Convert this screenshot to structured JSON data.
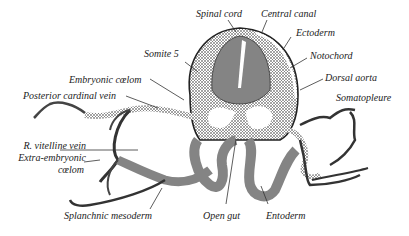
{
  "figure": {
    "labels": {
      "spinal_cord": "Spinal cord",
      "central_canal": "Central canal",
      "ectoderm": "Ectoderm",
      "somite": "Somite 5",
      "notochord": "Notochord",
      "embryonic_coelom": "Embryonic cœlom",
      "dorsal_aorta": "Dorsal aorta",
      "posterior_cardinal_vein": "Posterior cardinal vein",
      "somatopleure": "Somatopleure",
      "r_vitelline_vein": "R. vitelline vein",
      "extra_embryonic": "Extra-embryonic",
      "coelom": "cœlom",
      "splanchnic_mesoderm": "Splanchnic mesoderm",
      "open_gut": "Open gut",
      "entoderm": "Entoderm"
    },
    "caption_fragment": "",
    "colors": {
      "ink": "#222222",
      "tissue": "#555555",
      "background": "#ffffff"
    }
  }
}
